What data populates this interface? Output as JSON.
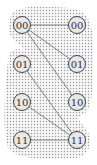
{
  "diagram": {
    "left_nodes": [
      {
        "label": "00",
        "x": 22,
        "y": 25
      },
      {
        "label": "01",
        "x": 22,
        "y": 64
      },
      {
        "label": "10",
        "x": 22,
        "y": 102
      },
      {
        "label": "11",
        "x": 22,
        "y": 140
      }
    ],
    "right_nodes": [
      {
        "label": "00",
        "x": 77,
        "y": 25
      },
      {
        "label": "01",
        "x": 77,
        "y": 64
      },
      {
        "label": "10",
        "x": 77,
        "y": 102
      },
      {
        "label": "11",
        "x": 77,
        "y": 140
      }
    ],
    "edges": [
      {
        "from": "L00",
        "to": "R00"
      },
      {
        "from": "L00",
        "to": "R01"
      },
      {
        "from": "L00",
        "to": "R10"
      },
      {
        "from": "L01",
        "to": "R11"
      },
      {
        "from": "L10",
        "to": "R11"
      },
      {
        "from": "L11",
        "to": "R11"
      }
    ],
    "colors": {
      "node_fill": "#e8e8e8",
      "node_stroke": "#444444",
      "edge": "#777777",
      "dots": "#9a9a9a"
    }
  }
}
